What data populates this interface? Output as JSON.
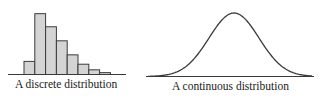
{
  "chart_data": [
    {
      "type": "bar",
      "title": "A discrete distribution",
      "xlabel": "",
      "ylabel": "",
      "categories": [
        "1",
        "2",
        "3",
        "4",
        "5",
        "6",
        "7",
        "8"
      ],
      "values": [
        14,
        65,
        51,
        36,
        21,
        11,
        5,
        2
      ],
      "ylim": [
        0,
        70
      ],
      "grid": false,
      "bar_color": "#d4d4d4",
      "edge_color": "#3a3a3a"
    },
    {
      "type": "line",
      "title": "A continuous distribution",
      "xlabel": "",
      "ylabel": "",
      "description": "Bell-shaped (normal-like) density curve",
      "x": [
        -3,
        -2.5,
        -2,
        -1.5,
        -1,
        -0.5,
        0,
        0.5,
        1,
        1.5,
        2,
        2.5,
        3
      ],
      "y": [
        0.004,
        0.018,
        0.054,
        0.13,
        0.242,
        0.352,
        0.399,
        0.352,
        0.242,
        0.13,
        0.054,
        0.018,
        0.004
      ],
      "grid": false,
      "line_color": "#3a3a3a"
    }
  ],
  "labels": {
    "discrete": "A discrete distribution",
    "continuous": "A continuous distribution"
  }
}
